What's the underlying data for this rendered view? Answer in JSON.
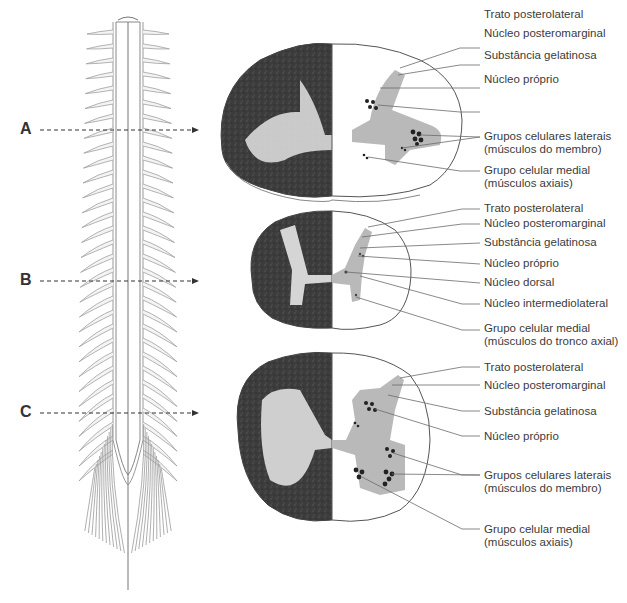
{
  "levels": [
    {
      "letter": "A",
      "arrow_y": 130,
      "labels": [
        {
          "text": "Trato posterolateral",
          "y": 15
        },
        {
          "text": "Núcleo posteromarginal",
          "y": 34
        },
        {
          "text": "Substância gelatinosa",
          "y": 56
        },
        {
          "text": "Núcleo próprio",
          "y": 80
        },
        {
          "text": "Grupos celulares laterais",
          "y": 104
        },
        {
          "text": "(músculos do membro)",
          "y": 117
        },
        {
          "text": "Grupo celular medial",
          "y": 138
        },
        {
          "text": "(músculos axiais)",
          "y": 151
        }
      ]
    },
    {
      "letter": "B",
      "arrow_y": 281,
      "labels": [
        {
          "text": "Trato posterolateral",
          "y": 202
        },
        {
          "text": "Núcleo posteromarginal",
          "y": 217
        },
        {
          "text": "Substância gelatinosa",
          "y": 236
        },
        {
          "text": "Núcleo próprio",
          "y": 257
        },
        {
          "text": "Núcleo dorsal",
          "y": 276
        },
        {
          "text": "Núcleo intermediolateral",
          "y": 297
        },
        {
          "text": "Grupo celular medial",
          "y": 322
        },
        {
          "text": "(músculos do tronco axial)",
          "y": 335
        }
      ]
    },
    {
      "letter": "C",
      "arrow_y": 413,
      "labels": [
        {
          "text": "Trato posterolateral",
          "y": 361
        },
        {
          "text": "Núcleo posteromarginal",
          "y": 379
        },
        {
          "text": "Substância gelatinosa",
          "y": 408
        },
        {
          "text": "Núcleo próprio",
          "y": 432
        },
        {
          "text": "Grupos celulares laterais",
          "y": 469
        },
        {
          "text": "(músculos do membro)",
          "y": 482
        },
        {
          "text": "Grupo celular medial",
          "y": 525
        },
        {
          "text": "(músculos axiais)",
          "y": 538
        }
      ]
    }
  ],
  "colors": {
    "gray_matter": "#b9b9b9",
    "stained_dark": "#3f3f3f",
    "stained_light": "#d8d8d8",
    "outline": "#555555",
    "leader": "#6b6b6b",
    "nerve": "#9a9a9a"
  }
}
